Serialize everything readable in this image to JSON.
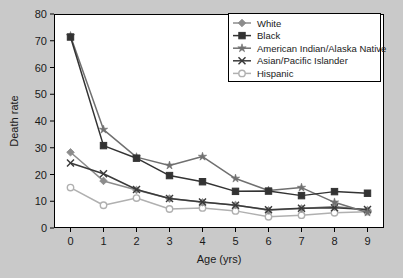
{
  "chart_data": {
    "type": "line",
    "title": "",
    "xlabel": "Age (yrs)",
    "ylabel": "Death rate",
    "x": [
      0,
      1,
      2,
      3,
      4,
      5,
      6,
      7,
      8,
      9
    ],
    "xlim": [
      -0.5,
      9.5
    ],
    "ylim": [
      0,
      80
    ],
    "xticks": [
      "0",
      "1",
      "2",
      "3",
      "4",
      "5",
      "6",
      "7",
      "8",
      "9"
    ],
    "yticks": [
      "0",
      "10",
      "20",
      "30",
      "40",
      "50",
      "60",
      "70",
      "80"
    ],
    "grid": false,
    "legend_position": "top-right",
    "series": [
      {
        "name": "White",
        "marker": "diamond",
        "color": "#8c8c8c",
        "values": [
          28.3,
          17.6,
          14.2,
          11.0,
          9.6,
          8.6,
          6.6,
          7.3,
          8.0,
          6.7
        ]
      },
      {
        "name": "Black",
        "marker": "square",
        "color": "#333333",
        "values": [
          71.4,
          30.8,
          26.1,
          19.6,
          17.3,
          13.7,
          13.8,
          12.1,
          13.6,
          13.0
        ]
      },
      {
        "name": "American Indian/Alaska Native",
        "marker": "star",
        "color": "#707070",
        "values": [
          71.8,
          36.8,
          26.5,
          23.4,
          26.7,
          18.5,
          14.0,
          15.1,
          9.6,
          5.8
        ]
      },
      {
        "name": "Asian/Pacific Islander",
        "marker": "x",
        "color": "#3a3a3a",
        "values": [
          24.3,
          20.3,
          14.4,
          11.0,
          9.7,
          8.5,
          6.8,
          7.4,
          7.6,
          6.9
        ]
      },
      {
        "name": "Hispanic",
        "marker": "circle",
        "color": "#b0b0b0",
        "values": [
          15.1,
          8.5,
          11.2,
          7.1,
          7.5,
          6.4,
          4.2,
          4.8,
          5.7,
          6.1
        ]
      }
    ]
  },
  "axes": {
    "x_title": "Age (yrs)",
    "y_title": "Death rate"
  },
  "legend": {
    "entries": [
      {
        "label": "White"
      },
      {
        "label": "Black"
      },
      {
        "label": "American Indian/Alaska Native"
      },
      {
        "label": "Asian/Pacific Islander"
      },
      {
        "label": "Hispanic"
      }
    ]
  },
  "colors": {
    "background": "#c9c9c9",
    "plot_background": "#ffffff",
    "axis": "#000000",
    "text": "#1a1a1a"
  }
}
